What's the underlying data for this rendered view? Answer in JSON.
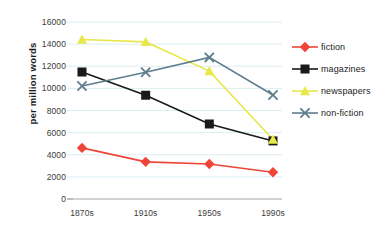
{
  "chart_data": {
    "type": "line",
    "title": "",
    "subtitle": "",
    "xlabel": "",
    "ylabel": "per million words",
    "categories": [
      "1870s",
      "1910s",
      "1950s",
      "1990s"
    ],
    "ylim": [
      0,
      16000
    ],
    "ytick_step": 2000,
    "yticks": [
      "0",
      "2000",
      "4000",
      "6000",
      "8000",
      "10000",
      "12000",
      "14000",
      "16000"
    ],
    "ytick_values": [
      0,
      2000,
      4000,
      6000,
      8000,
      10000,
      12000,
      14000,
      16000
    ],
    "grid": true,
    "grid_color": "#dbeef2",
    "axis_color": "#a8a8a8",
    "legend_position": "right",
    "series": [
      {
        "name": "fiction",
        "color": "#f04438",
        "marker": "diamond",
        "values": [
          4620,
          3360,
          3160,
          2420
        ]
      },
      {
        "name": "magazines",
        "color": "#1a1a1a",
        "marker": "square",
        "values": [
          11480,
          9380,
          6780,
          5250
        ]
      },
      {
        "name": "newspapers",
        "color": "#e8e84a",
        "marker": "triangle",
        "values": [
          14420,
          14200,
          11560,
          5380
        ]
      },
      {
        "name": "non-fiction",
        "color": "#5f7d8c",
        "marker": "x",
        "values": [
          10220,
          11460,
          12800,
          9400
        ]
      }
    ]
  }
}
